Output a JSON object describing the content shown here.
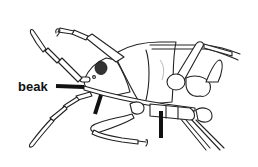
{
  "figure": {
    "labels": [
      {
        "id": "beak",
        "text": "beak",
        "x": 18,
        "y": 83
      }
    ],
    "pointers": [
      {
        "id": "beak-pointer",
        "x1": 56,
        "y1": 86,
        "x2": 84,
        "y2": 88
      },
      {
        "id": "beak-mid-pointer",
        "x1": 102,
        "y1": 96,
        "x2": 96,
        "y2": 114
      },
      {
        "id": "beak-tip-pointer",
        "x1": 161,
        "y1": 112,
        "x2": 161,
        "y2": 138
      }
    ]
  },
  "colors": {
    "line": "#222222",
    "pointer": "#111111",
    "eye": "#333333",
    "background": "#ffffff"
  }
}
